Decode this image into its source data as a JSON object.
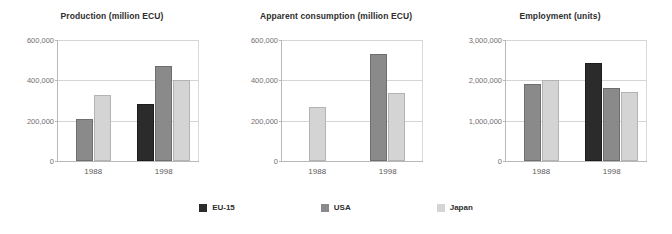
{
  "legend": {
    "position": "bottom-center",
    "items": [
      {
        "label": "EU-15",
        "color": "#2b2b2b",
        "key": "eu"
      },
      {
        "label": "USA",
        "color": "#8a8a8a",
        "key": "usa"
      },
      {
        "label": "Japan",
        "color": "#d4d4d4",
        "key": "japan"
      }
    ]
  },
  "chart_data": [
    {
      "type": "bar",
      "title": "Production (million ECU)",
      "xlabel": "",
      "ylabel": "",
      "categories": [
        "1988",
        "1998"
      ],
      "ylim": [
        0,
        600000
      ],
      "yticks": [
        0,
        200000,
        400000,
        600000
      ],
      "ytick_labels": [
        "0",
        "200,000",
        "400,000",
        "600,000"
      ],
      "grid": true,
      "series": [
        {
          "name": "EU-15",
          "color": "#2b2b2b",
          "values": [
            null,
            285000
          ]
        },
        {
          "name": "USA",
          "color": "#8a8a8a",
          "values": [
            210000,
            470000
          ]
        },
        {
          "name": "Japan",
          "color": "#d4d4d4",
          "values": [
            325000,
            400000
          ]
        }
      ]
    },
    {
      "type": "bar",
      "title": "Apparent consumption (million ECU)",
      "xlabel": "",
      "ylabel": "",
      "categories": [
        "1988",
        "1998"
      ],
      "ylim": [
        0,
        600000
      ],
      "yticks": [
        0,
        200000,
        400000,
        600000
      ],
      "ytick_labels": [
        "0",
        "200,000",
        "400,000",
        "600,000"
      ],
      "grid": true,
      "series": [
        {
          "name": "EU-15",
          "color": "#2b2b2b",
          "values": [
            null,
            null
          ]
        },
        {
          "name": "USA",
          "color": "#8a8a8a",
          "values": [
            null,
            530000
          ]
        },
        {
          "name": "Japan",
          "color": "#d4d4d4",
          "values": [
            270000,
            335000
          ]
        }
      ]
    },
    {
      "type": "bar",
      "title": "Employment (units)",
      "xlabel": "",
      "ylabel": "",
      "categories": [
        "1988",
        "1998"
      ],
      "ylim": [
        0,
        3000000
      ],
      "yticks": [
        0,
        1000000,
        2000000,
        3000000
      ],
      "ytick_labels": [
        "0",
        "1,000,000",
        "2,000,000",
        "3,000,000"
      ],
      "grid": true,
      "series": [
        {
          "name": "EU-15",
          "color": "#2b2b2b",
          "values": [
            null,
            2420000
          ]
        },
        {
          "name": "USA",
          "color": "#8a8a8a",
          "values": [
            1920000,
            1810000
          ]
        },
        {
          "name": "Japan",
          "color": "#d4d4d4",
          "values": [
            2000000,
            1720000
          ]
        }
      ]
    }
  ]
}
